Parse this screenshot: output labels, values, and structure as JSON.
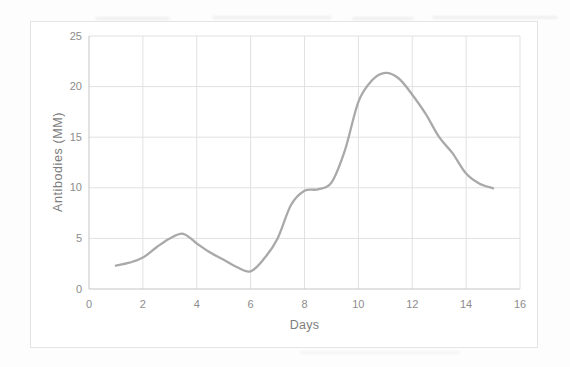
{
  "chart_data": {
    "type": "line",
    "title": "",
    "xlabel": "Days",
    "ylabel": "Antibodies (MM)",
    "xlim": [
      0,
      16
    ],
    "ylim": [
      0,
      25
    ],
    "x_ticks": [
      0,
      2,
      4,
      6,
      8,
      10,
      12,
      14,
      16
    ],
    "y_ticks": [
      0,
      5,
      10,
      15,
      20,
      25
    ],
    "grid": true,
    "legend": false,
    "series": [
      {
        "name": "Antibodies (MM)",
        "color": "#a9a9a9",
        "line_width": 2.3,
        "smooth": true,
        "points": [
          [
            1,
            2.3
          ],
          [
            1.5,
            2.6
          ],
          [
            2,
            3.1
          ],
          [
            2.5,
            4.1
          ],
          [
            3,
            5.0
          ],
          [
            3.5,
            5.45
          ],
          [
            4,
            4.5
          ],
          [
            4.5,
            3.6
          ],
          [
            5,
            2.9
          ],
          [
            5.5,
            2.15
          ],
          [
            6,
            1.75
          ],
          [
            6.5,
            3.0
          ],
          [
            7,
            5.0
          ],
          [
            7.5,
            8.3
          ],
          [
            8,
            9.7
          ],
          [
            8.5,
            9.85
          ],
          [
            9,
            10.5
          ],
          [
            9.5,
            13.7
          ],
          [
            10,
            18.5
          ],
          [
            10.5,
            20.6
          ],
          [
            11,
            21.35
          ],
          [
            11.5,
            20.8
          ],
          [
            12,
            19.2
          ],
          [
            12.5,
            17.3
          ],
          [
            13,
            15.0
          ],
          [
            13.5,
            13.4
          ],
          [
            14,
            11.4
          ],
          [
            14.5,
            10.4
          ],
          [
            15,
            9.95
          ]
        ]
      }
    ]
  },
  "colors": {
    "gridline": "#e1e1e1",
    "axis_line": "#c5c5c5",
    "tick_label": "#8c8c8c",
    "axis_title": "#7d7d7d",
    "card_border": "#e6e4e2",
    "page_background": "#fdfdfd"
  }
}
